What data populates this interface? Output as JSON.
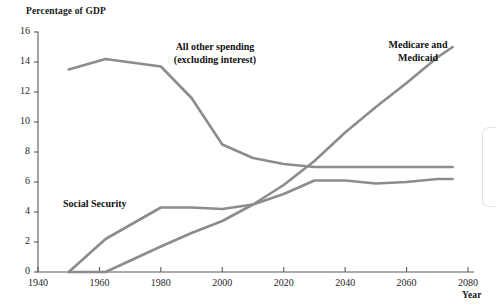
{
  "chart_data": {
    "type": "line",
    "title": "",
    "ylabel": "Percentage of GDP",
    "xlabel": "Year",
    "xlim": [
      1940,
      2080
    ],
    "ylim": [
      0,
      16
    ],
    "xticks": [
      1940,
      1960,
      1980,
      2000,
      2020,
      2040,
      2060,
      2080
    ],
    "yticks": [
      0,
      2,
      4,
      6,
      8,
      10,
      12,
      14,
      16
    ],
    "grid": false,
    "legend_position": "inline-annotations",
    "line_color": "#8c8c8c",
    "axis_color": "#5a5a5a",
    "series": [
      {
        "name": "All other spending (excluding interest)",
        "annotation": "All other spending\n(excluding interest)",
        "x": [
          1950,
          1962,
          1980,
          1990,
          2000,
          2010,
          2020,
          2030,
          2040,
          2050,
          2060,
          2070,
          2075
        ],
        "values": [
          13.5,
          14.2,
          13.7,
          11.6,
          8.5,
          7.6,
          7.2,
          7.0,
          7.0,
          7.0,
          7.0,
          7.0,
          7.0
        ]
      },
      {
        "name": "Social Security",
        "annotation": "Social Security",
        "x": [
          1950,
          1962,
          1980,
          1990,
          2000,
          2010,
          2020,
          2030,
          2040,
          2050,
          2060,
          2070,
          2075
        ],
        "values": [
          0.0,
          2.2,
          4.3,
          4.3,
          4.2,
          4.5,
          5.2,
          6.1,
          6.1,
          5.9,
          6.0,
          6.2,
          6.2
        ]
      },
      {
        "name": "Medicare and Medicaid",
        "annotation": "Medicare and\nMedicaid",
        "x": [
          1950,
          1962,
          1980,
          1990,
          2000,
          2010,
          2020,
          2030,
          2040,
          2050,
          2060,
          2070,
          2075
        ],
        "values": [
          0.0,
          0.0,
          1.7,
          2.6,
          3.4,
          4.5,
          5.8,
          7.4,
          9.3,
          11.0,
          12.6,
          14.3,
          15.0
        ]
      }
    ]
  },
  "axes": {
    "y_title": "Percentage of GDP",
    "x_title": "Year",
    "y_tick_labels": [
      "16",
      "14",
      "12",
      "10",
      "8",
      "6",
      "4",
      "2",
      "0"
    ],
    "x_tick_labels": [
      "1940",
      "1960",
      "1980",
      "2000",
      "2020",
      "2040",
      "2060",
      "2080"
    ]
  },
  "annotations": {
    "all_other_spending": "All other spending\n(excluding interest)",
    "medicare_medicaid": "Medicare and\nMedicaid",
    "social_security": "Social Security"
  }
}
